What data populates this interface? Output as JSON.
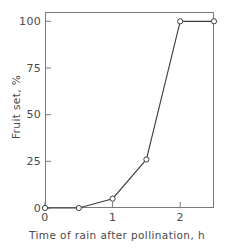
{
  "chart_data": {
    "type": "line",
    "title": "",
    "xlabel": "Time of rain after pollination, h",
    "ylabel": "Fruit set, %",
    "xlim": [
      0,
      2.5
    ],
    "ylim": [
      0,
      105
    ],
    "grid": false,
    "legend": "none",
    "marker": "open-circle",
    "line_color": "#3c3c3c",
    "x": [
      0,
      0.5,
      1,
      1.5,
      2,
      2.5
    ],
    "values": [
      0,
      0,
      5,
      26,
      100,
      100
    ],
    "series": [
      {
        "name": "Fruit set",
        "points": [
          {
            "x": 0,
            "y": 0
          },
          {
            "x": 0.5,
            "y": 0
          },
          {
            "x": 1,
            "y": 5
          },
          {
            "x": 1.5,
            "y": 26
          },
          {
            "x": 2,
            "y": 100
          },
          {
            "x": 2.5,
            "y": 100
          }
        ]
      }
    ],
    "xticks": [
      {
        "value": 0,
        "label": "0"
      },
      {
        "value": 1,
        "label": "1"
      },
      {
        "value": 2,
        "label": "2"
      }
    ],
    "yticks": [
      {
        "value": 0,
        "label": "0"
      },
      {
        "value": 25,
        "label": "25"
      },
      {
        "value": 50,
        "label": "50"
      },
      {
        "value": 75,
        "label": "75"
      },
      {
        "value": 100,
        "label": "100"
      }
    ],
    "axis_color": "#7a7a7a"
  }
}
